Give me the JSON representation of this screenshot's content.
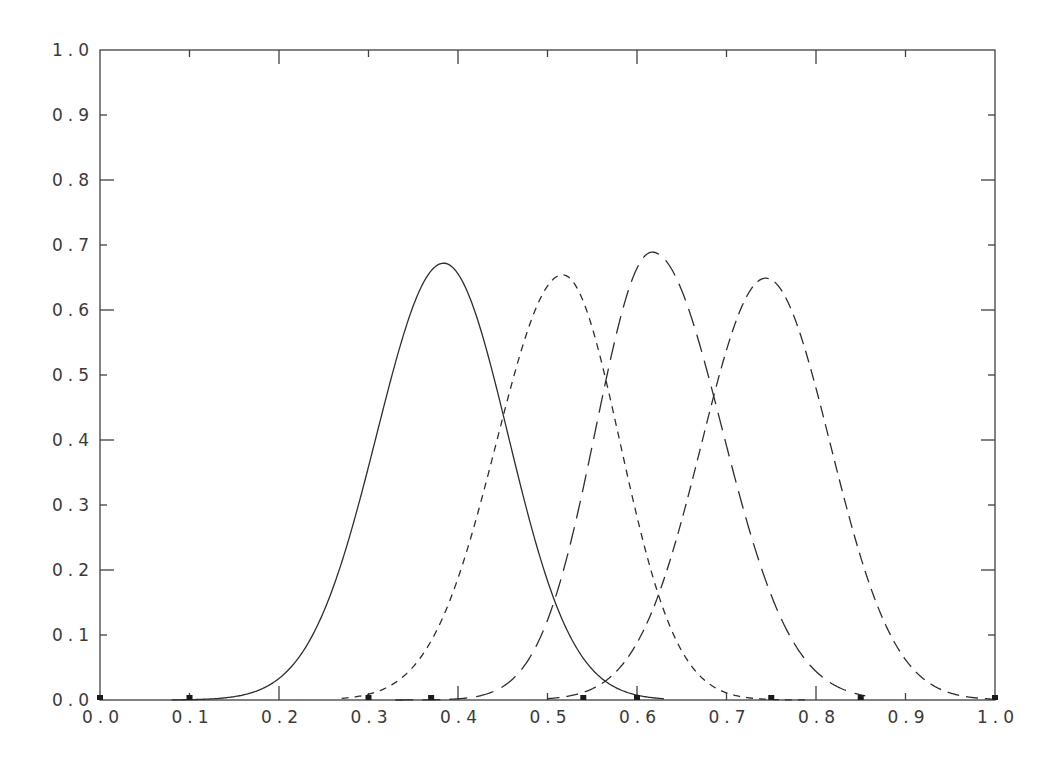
{
  "chart_data": {
    "type": "line",
    "title": "",
    "xlabel": "",
    "ylabel": "",
    "xlim": [
      0.0,
      1.0
    ],
    "ylim": [
      0.0,
      1.0
    ],
    "grid": false,
    "legend": null,
    "x_ticks": [
      "0.0",
      "0.1",
      "0.2",
      "0.3",
      "0.4",
      "0.5",
      "0.6",
      "0.7",
      "0.8",
      "0.9",
      "1.0"
    ],
    "y_ticks": [
      "0.0",
      "0.1",
      "0.2",
      "0.3",
      "0.4",
      "0.5",
      "0.6",
      "0.7",
      "0.8",
      "0.9",
      "1.0"
    ],
    "series": [
      {
        "name": "curve-1",
        "style": "solid",
        "peak": {
          "x": 0.384,
          "y": 0.672
        },
        "sigma_left": 0.075,
        "sigma_right": 0.072,
        "x": [
          0.12,
          0.2,
          0.26,
          0.27,
          0.28,
          0.318,
          0.34,
          0.365,
          0.384,
          0.452,
          0.507,
          0.55,
          0.59
        ],
        "y": [
          0.0,
          0.04,
          0.15,
          0.2,
          0.21,
          0.43,
          0.58,
          0.65,
          0.672,
          0.46,
          0.17,
          0.05,
          0.0
        ]
      },
      {
        "name": "curve-2",
        "style": "short-dash",
        "peak": {
          "x": 0.517,
          "y": 0.654
        },
        "sigma_left": 0.074,
        "sigma_right": 0.064,
        "x": [
          0.31,
          0.402,
          0.452,
          0.517,
          0.566,
          0.615,
          0.628,
          0.7,
          0.75
        ],
        "y": [
          0.0,
          0.2,
          0.46,
          0.654,
          0.495,
          0.2,
          0.16,
          0.02,
          0.0
        ]
      },
      {
        "name": "curve-3",
        "style": "long-dash",
        "peak": {
          "x": 0.617,
          "y": 0.689
        },
        "sigma_left": 0.063,
        "sigma_right": 0.078,
        "x": [
          0.37,
          0.45,
          0.507,
          0.517,
          0.566,
          0.617,
          0.685,
          0.745,
          0.815
        ],
        "y": [
          0.0,
          0.03,
          0.17,
          0.2,
          0.495,
          0.689,
          0.465,
          0.2,
          0.0
        ]
      },
      {
        "name": "curve-4",
        "style": "medium-dash",
        "peak": {
          "x": 0.744,
          "y": 0.649
        },
        "sigma_left": 0.072,
        "sigma_right": 0.072,
        "x": [
          0.54,
          0.628,
          0.685,
          0.744,
          0.819,
          0.849,
          0.92,
          0.98
        ],
        "y": [
          0.0,
          0.16,
          0.465,
          0.649,
          0.4,
          0.2,
          0.03,
          0.0
        ]
      }
    ],
    "markers_on_x_axis": [
      0.0,
      0.1,
      0.3,
      0.37,
      0.54,
      0.6,
      0.75,
      0.85,
      1.0
    ]
  }
}
